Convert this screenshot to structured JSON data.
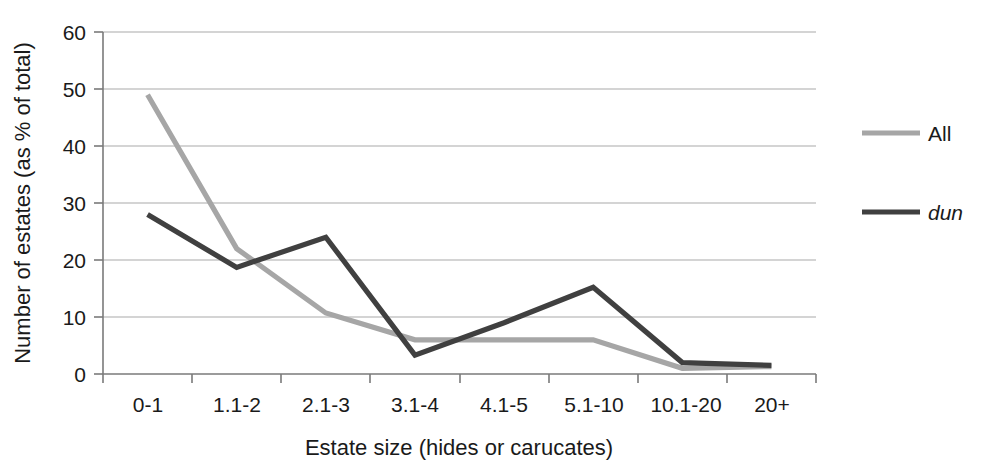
{
  "chart_data": {
    "type": "line",
    "title": "",
    "xlabel": "Estate size (hides or carucates)",
    "ylabel": "Number of estates (as % of total)",
    "categories": [
      "0-1",
      "1.1-2",
      "2.1-3",
      "3.1-4",
      "4.1-5",
      "5.1-10",
      "10.1-20",
      "20+"
    ],
    "ylim": [
      0,
      60
    ],
    "yticks": [
      0,
      10,
      20,
      30,
      40,
      50,
      60
    ],
    "ytick_labels": [
      "0",
      "10",
      "20",
      "30",
      "40",
      "50",
      "60"
    ],
    "grid": true,
    "legend_position": "right",
    "series": [
      {
        "name": "All",
        "color": "#a6a6a6",
        "values": [
          49,
          22,
          10.7,
          6,
          6,
          6,
          1,
          1.3
        ]
      },
      {
        "name": "dun",
        "color": "#404040",
        "italic": true,
        "values": [
          28,
          18.7,
          24,
          3.3,
          9,
          15.2,
          2,
          1.5
        ]
      }
    ]
  },
  "axes": {
    "y_title": "Number of estates (as % of total)",
    "x_title": "Estate size (hides or carucates)",
    "y_tick_labels": [
      "60",
      "50",
      "40",
      "30",
      "20",
      "10",
      "0"
    ],
    "x_tick_labels": [
      "0-1",
      "1.1-2",
      "2.1-3",
      "3.1-4",
      "4.1-5",
      "5.1-10",
      "10.1-20",
      "20+"
    ]
  },
  "legend": {
    "items": [
      {
        "label": "All",
        "color": "#a6a6a6"
      },
      {
        "label": "dun",
        "color": "#404040"
      }
    ]
  },
  "colors": {
    "all_series": "#a6a6a6",
    "dun_series": "#404040",
    "gridline": "#a9a9a9",
    "axis": "#7a7a7a",
    "text": "#1a1a1a",
    "background": "#ffffff"
  }
}
